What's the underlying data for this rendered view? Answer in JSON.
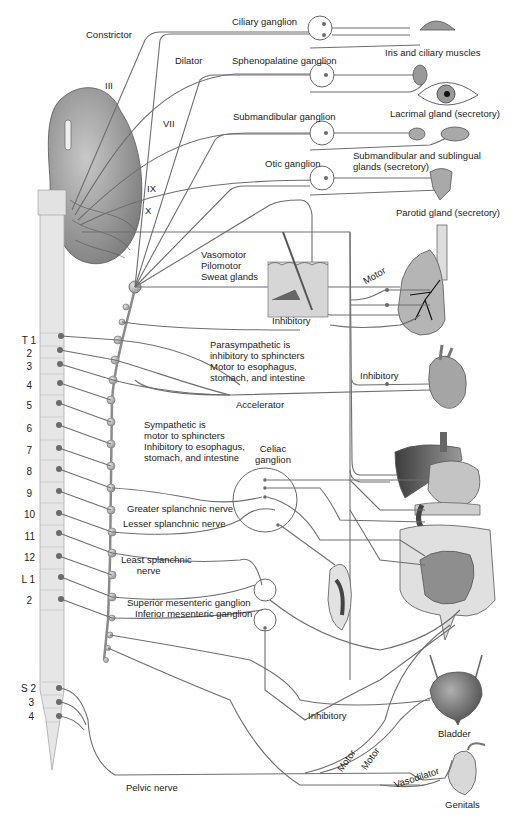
{
  "cranial_nerves": [
    "III",
    "VII",
    "IX",
    "X"
  ],
  "head_labels": {
    "constrictor": "Constrictor",
    "dilator": "Dilator",
    "ciliary_ganglion": "Ciliary ganglion",
    "sphenopalatine_ganglion": "Sphenopalatine ganglion",
    "submandibular_ganglion": "Submandibular ganglion",
    "otic_ganglion": "Otic ganglion"
  },
  "organs": {
    "iris": "Iris and ciliary muscles",
    "lacrimal": "Lacrimal gland (secretory)",
    "submandibular_sublingual": "Submandibular and sublingual\nglands (secretory)",
    "parotid": "Parotid gland (secretory)",
    "bladder": "Bladder",
    "genitals": "Genitals"
  },
  "skin_effects": "Vasomotor\nPilomotor\nSweat glands",
  "notes": {
    "parasympathetic": "Parasympathetic is\ninhibitory to sphincters\nMotor to esophagus,\nstomach, and intestine",
    "sympathetic": "Sympathetic is\nmotor to sphincters\nInhibitory to esophagus,\nstomach, and intestine"
  },
  "nerve_labels": {
    "motor_lung": "Motor",
    "inhibitory_lung": "Inhibitory",
    "inhibitory_heart": "Inhibitory",
    "accelerator": "Accelerator",
    "celiac_ganglion": "Celiac\nganglion",
    "greater_splanchnic": "Greater splanchnic nerve",
    "lesser_splanchnic": "Lesser splanchnic nerve",
    "least_splanchnic": "Least splanchnic\n      nerve",
    "superior_mesenteric": "Superior mesenteric ganglion",
    "inferior_mesenteric": "Inferior mesenteric ganglion",
    "inhibitory_bladder": "Inhibitory",
    "motor_1": "Motor",
    "motor_2": "Motor",
    "vasodilator": "Vasodilator",
    "pelvic_nerve": "Pelvic nerve"
  },
  "spinal_segments": [
    {
      "label": "T 1",
      "y": 340
    },
    {
      "label": "2",
      "y": 352
    },
    {
      "label": "3",
      "y": 365
    },
    {
      "label": "4",
      "y": 385
    },
    {
      "label": "5",
      "y": 405
    },
    {
      "label": "6",
      "y": 428
    },
    {
      "label": "7",
      "y": 450
    },
    {
      "label": "8",
      "y": 470
    },
    {
      "label": "9",
      "y": 493
    },
    {
      "label": "10",
      "y": 514
    },
    {
      "label": "11",
      "y": 537
    },
    {
      "label": "12",
      "y": 558
    },
    {
      "label": "L 1",
      "y": 579
    },
    {
      "label": "2",
      "y": 600
    },
    {
      "label": "S 2",
      "y": 688
    },
    {
      "label": "3",
      "y": 702
    },
    {
      "label": "4",
      "y": 715
    }
  ],
  "colors": {
    "nerve": "#6e6e6e",
    "spinal_cord": "#e6e6e6",
    "organ_fill": "#bcbcbc",
    "organ_dark": "#5a5a5a",
    "background": "#ffffff"
  }
}
